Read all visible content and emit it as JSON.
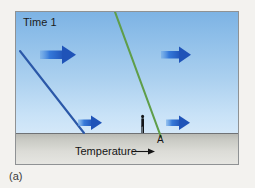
{
  "figure": {
    "caption": "(a)",
    "panel": {
      "time_label": "Time 1",
      "axis_label": "Temperature",
      "axis_arrow": "→",
      "point_label": "A"
    },
    "colors": {
      "sky_top": "#7db3e4",
      "sky_bottom": "#d4e8f9",
      "ground_top": "#b9bab4",
      "ground_bottom": "#e7e7e3",
      "blue_line": "#2b58a8",
      "green_line": "#5f9e4a",
      "arrow_blue": "#2a6fd6",
      "frame": "#8f9294",
      "figure_person": "#14161a",
      "page_background": "#f3f2ef"
    },
    "profiles": [
      {
        "name": "cold-air-temperature-profile",
        "color": "#2b58a8",
        "x1": 4,
        "y1": 39,
        "x2": 68,
        "y2": 121
      },
      {
        "name": "warm-air-temperature-profile",
        "color": "#5f9e4a",
        "x1": 99,
        "y1": 0,
        "x2": 145,
        "y2": 124
      }
    ],
    "wind_arrows": [
      {
        "name": "wind-arrow-upper-left",
        "x": 24,
        "y": 42,
        "length": 34,
        "thickness": 9
      },
      {
        "name": "wind-arrow-upper-right",
        "x": 145,
        "y": 42,
        "length": 30,
        "thickness": 8
      },
      {
        "name": "wind-arrow-lower-left",
        "x": 62,
        "y": 110,
        "length": 24,
        "thickness": 7
      },
      {
        "name": "wind-arrow-lower-right",
        "x": 150,
        "y": 110,
        "length": 25,
        "thickness": 7
      }
    ]
  }
}
